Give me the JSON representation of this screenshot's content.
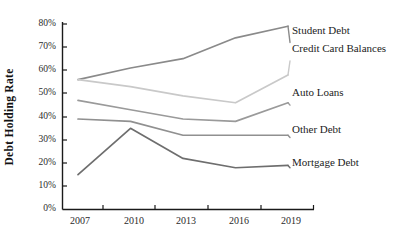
{
  "chart_data": {
    "type": "line",
    "title": "",
    "xlabel": "",
    "ylabel": "Debt Holding Rate",
    "x": [
      "2007",
      "2010",
      "2013",
      "2016",
      "2019"
    ],
    "categories": [
      "2007",
      "2010",
      "2013",
      "2016",
      "2019"
    ],
    "ylim": [
      0,
      80
    ],
    "xlim": [
      2007,
      2019
    ],
    "ytick_labels": [
      "0%",
      "10%",
      "20%",
      "30%",
      "40%",
      "50%",
      "60%",
      "70%",
      "80%"
    ],
    "ytick_values": [
      0,
      10,
      20,
      30,
      40,
      50,
      60,
      70,
      80
    ],
    "xtick_labels": [
      "2007",
      "2010",
      "2013",
      "2016",
      "2019"
    ],
    "grid": false,
    "legend_position": "right-inline-labels",
    "series": [
      {
        "name": "Student Debt",
        "color": "#8a8a8a",
        "values": [
          56,
          61,
          65,
          74,
          79
        ],
        "label_y": 72
      },
      {
        "name": "Credit Card Balances",
        "color": "#c9c9c9",
        "values": [
          56,
          53,
          49,
          46,
          58
        ],
        "label_y": 64
      },
      {
        "name": "Auto Loans",
        "color": "#9a9a9a",
        "values": [
          47,
          43,
          39,
          38,
          46
        ],
        "label_y": 45
      },
      {
        "name": "Other Debt",
        "color": "#909090",
        "values": [
          39,
          38,
          32,
          32,
          32
        ],
        "label_y": 31
      },
      {
        "name": "Mortgage Debt",
        "color": "#6e6e6e",
        "values": [
          15,
          35,
          22,
          18,
          19
        ],
        "label_y": 18
      }
    ]
  },
  "axis": {
    "y_title": "Debt Holding Rate",
    "y_ticks": [
      "80%",
      "70%",
      "60%",
      "50%",
      "40%",
      "30%",
      "20%",
      "10%",
      "0%"
    ],
    "x_ticks": [
      "2007",
      "2010",
      "2013",
      "2016",
      "2019"
    ]
  },
  "labels": {
    "student_debt": "Student Debt",
    "credit_card_balances": "Credit Card Balances",
    "auto_loans": "Auto Loans",
    "other_debt": "Other Debt",
    "mortgage_debt": "Mortgage Debt"
  }
}
